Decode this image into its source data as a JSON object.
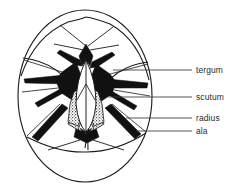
{
  "figure": {
    "kind": "anatomical-line-diagram",
    "background_color": "#ffffff",
    "line_color": "#1a1a1a",
    "fill_dark_color": "#111111",
    "stipple_color": "#3a3a3a",
    "canvas": {
      "width": 241,
      "height": 194
    },
    "outline": {
      "shape": "ellipse",
      "center_x": 85,
      "center_y": 96,
      "radius_x": 67,
      "radius_y": 86
    }
  },
  "labels": [
    {
      "id": "tergum",
      "text": "tergum",
      "leader_y": 70,
      "leader_x_start": 113,
      "leader_x_end": 192,
      "text_x": 196,
      "text_y": 65
    },
    {
      "id": "scutum",
      "text": "scutum",
      "leader_y": 97,
      "leader_x_start": 108,
      "leader_x_end": 192,
      "text_x": 196,
      "text_y": 92
    },
    {
      "id": "radius",
      "text": "radius",
      "leader_y": 118,
      "leader_x_start": 126,
      "leader_x_end": 192,
      "text_x": 196,
      "text_y": 113
    },
    {
      "id": "ala",
      "text": "ala",
      "leader_y": 131,
      "leader_x_start": 136,
      "leader_x_end": 192,
      "text_x": 196,
      "text_y": 126
    }
  ],
  "plates": [
    {
      "id": "upper-left-plate",
      "name": "upper left shell plate"
    },
    {
      "id": "upper-right-plate",
      "name": "upper right shell plate"
    },
    {
      "id": "left-plate",
      "name": "left shell plate"
    },
    {
      "id": "right-plate",
      "name": "right shell plate"
    },
    {
      "id": "bottom-plate",
      "name": "bottom carinal plate"
    },
    {
      "id": "tergum-left",
      "name": "left tergum"
    },
    {
      "id": "tergum-right",
      "name": "right tergum"
    },
    {
      "id": "scutum-left",
      "name": "left scutum (stippled)"
    },
    {
      "id": "scutum-right",
      "name": "right scutum (stippled)"
    }
  ]
}
